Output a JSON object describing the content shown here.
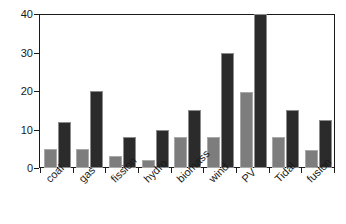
{
  "chart_data": {
    "type": "bar",
    "title": "",
    "subtitle": "",
    "xlabel": "",
    "ylabel": "",
    "ylim": [
      0,
      40
    ],
    "yticks": [
      0,
      10,
      20,
      30,
      40
    ],
    "ytick_labels": [
      "0",
      "10",
      "20",
      "30",
      "40"
    ],
    "grid": false,
    "legend": "none",
    "categories": [
      "coal",
      "gas",
      "fission",
      "hydro",
      "biomass",
      "wind",
      "PV",
      "Tidal",
      "fusion"
    ],
    "series": [
      {
        "name": "series-1",
        "color": "#7d7d7d",
        "values": [
          5,
          5,
          3,
          2,
          8,
          8,
          19.7,
          8,
          4.7
        ]
      },
      {
        "name": "series-2",
        "color": "#2b2b2b",
        "values": [
          12,
          20,
          8,
          10,
          15,
          30,
          40,
          15,
          12.5
        ]
      }
    ],
    "annotations": []
  },
  "axes": {
    "y_tick_0": "0",
    "y_tick_1": "10",
    "y_tick_2": "20",
    "y_tick_3": "30",
    "y_tick_4": "40"
  }
}
